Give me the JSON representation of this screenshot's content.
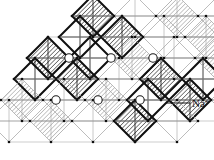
{
  "figure": {
    "kind": "crystal-structure-diagram",
    "background_color": "#ffffff"
  },
  "annotations": [
    {
      "id": "na-ion",
      "text": "Na",
      "superscript": "+",
      "leader_from": [
        166,
        103
      ],
      "leader_to": [
        190,
        103
      ],
      "label_x": 192,
      "label_y": 107
    }
  ],
  "legend": {
    "ion_label": "Na",
    "ion_charge": "+"
  },
  "lattice": {
    "cell_pitch_px": 42,
    "row_shear_px": -13,
    "diamond_half_diagonal_px": 21,
    "hatch_spacing_px": 2.2,
    "hatch_angle_deg": 45,
    "colors": {
      "hatch_dark": "#2b2b2b",
      "hatch_light": "#8d8d8d",
      "outline_bold": "#101010",
      "outline_light": "#a6a6a6",
      "grid_line": "#9a9a9a",
      "node_dot": "#101010",
      "ion_circle_stroke": "#1a1a1a",
      "ion_circle_fill": "#ffffff"
    },
    "nodes_visible": true,
    "grid_visible": true
  },
  "ions": {
    "symbol": "Na+",
    "radius_px": 4.2,
    "positions": [
      {
        "x": 69,
        "y": 58
      },
      {
        "x": 111,
        "y": 58
      },
      {
        "x": 153,
        "y": 58
      },
      {
        "x": 56,
        "y": 100
      },
      {
        "x": 98,
        "y": 100
      },
      {
        "x": 140,
        "y": 100
      }
    ]
  },
  "cells": {
    "comment": "lattice site list: col/row index, shading class, outline weight",
    "rows": [
      {
        "row": 0,
        "x0": 93,
        "y": 16,
        "count": 4,
        "shaded": [
          true,
          false,
          true,
          false
        ],
        "bold": [
          true,
          false,
          false,
          false
        ]
      },
      {
        "row": 1,
        "x0": 80,
        "y": 37,
        "count": 5,
        "shaded": [
          false,
          true,
          false,
          true,
          false
        ],
        "bold": [
          true,
          true,
          false,
          false,
          false
        ]
      },
      {
        "row": 2,
        "x0": 48,
        "y": 58,
        "count": 6,
        "shaded": [
          true,
          false,
          true,
          false,
          true,
          false
        ],
        "bold": [
          true,
          true,
          false,
          false,
          false,
          false
        ]
      },
      {
        "row": 3,
        "x0": 35,
        "y": 79,
        "count": 6,
        "shaded": [
          false,
          true,
          false,
          true,
          false,
          true
        ],
        "bold": [
          true,
          true,
          false,
          true,
          true,
          false
        ]
      },
      {
        "row": 4,
        "x0": 22,
        "y": 100,
        "count": 6,
        "shaded": [
          true,
          false,
          true,
          false,
          true,
          false
        ],
        "bold": [
          false,
          false,
          false,
          true,
          true,
          false
        ]
      },
      {
        "row": 5,
        "x0": 9,
        "y": 121,
        "count": 5,
        "shaded": [
          false,
          true,
          false,
          true,
          false
        ],
        "bold": [
          false,
          false,
          false,
          true,
          false
        ]
      }
    ]
  }
}
